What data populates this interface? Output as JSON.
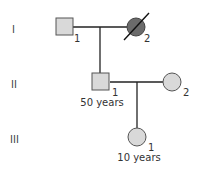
{
  "pedigree": {
    "generations": [
      {
        "label": "I"
      },
      {
        "label": "II"
      },
      {
        "label": "III"
      }
    ],
    "individuals": {
      "I1": {
        "number": "1",
        "sex": "male",
        "affected": false,
        "deceased": false,
        "age": ""
      },
      "I2": {
        "number": "2",
        "sex": "female",
        "affected": true,
        "deceased": true,
        "age": ""
      },
      "II1": {
        "number": "1",
        "sex": "male",
        "affected": false,
        "deceased": false,
        "age": "50 years"
      },
      "II2": {
        "number": "2",
        "sex": "female",
        "affected": false,
        "deceased": false,
        "age": ""
      },
      "III1": {
        "number": "1",
        "sex": "female",
        "affected": false,
        "deceased": false,
        "age": "10 years"
      }
    },
    "colors": {
      "unaffected_fill": "#d9d9d9",
      "affected_fill": "#6b6b6b",
      "stroke": "#555555",
      "line": "#222222"
    }
  }
}
